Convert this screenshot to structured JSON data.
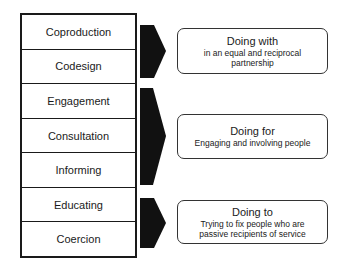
{
  "ladder": {
    "rungs": [
      {
        "label": "Coproduction"
      },
      {
        "label": "Codesign"
      },
      {
        "label": "Engagement"
      },
      {
        "label": "Consultation"
      },
      {
        "label": "Informing"
      },
      {
        "label": "Educating"
      },
      {
        "label": "Coercion"
      }
    ]
  },
  "groups": [
    {
      "title": "Doing with",
      "description": "in an equal and reciprocal partnership",
      "rungs": [
        "Coproduction",
        "Codesign"
      ]
    },
    {
      "title": "Doing for",
      "description": "Engaging and involving people",
      "rungs": [
        "Engagement",
        "Consultation",
        "Informing"
      ]
    },
    {
      "title": "Doing to",
      "description": "Trying to fix people who are passive recipients of service",
      "rungs": [
        "Educating",
        "Coercion"
      ]
    }
  ],
  "colors": {
    "arrow": "#111111",
    "border": "#1a1a1a",
    "background": "#ffffff"
  }
}
